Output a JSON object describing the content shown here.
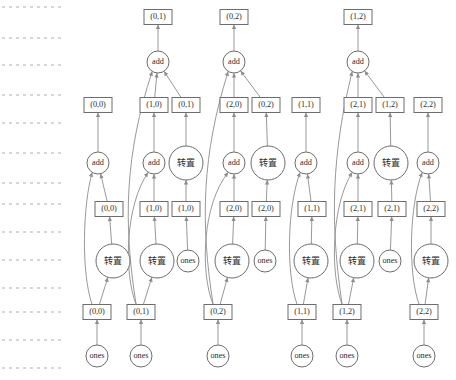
{
  "diagram": {
    "width": 456,
    "height": 380,
    "background_color": "#ffffff",
    "node_stroke_color": "#6d6d6d",
    "edge_color": "#8d8d8d",
    "guide_color": "#9a9a9a",
    "text_color": "#2b2b2b",
    "operator_labels": {
      "add": "add",
      "transpose": "转置",
      "ones": "ones"
    },
    "rank_guides": [
      {
        "name": "rank-guide-1",
        "y": 7
      },
      {
        "name": "rank-guide-2",
        "y": 38
      },
      {
        "name": "rank-guide-3",
        "y": 65
      },
      {
        "name": "rank-guide-4",
        "y": 95
      },
      {
        "name": "rank-guide-5",
        "y": 123
      },
      {
        "name": "rank-guide-6",
        "y": 153
      },
      {
        "name": "rank-guide-7",
        "y": 183
      },
      {
        "name": "rank-guide-8",
        "y": 204
      },
      {
        "name": "rank-guide-9",
        "y": 232
      },
      {
        "name": "rank-guide-10",
        "y": 260
      },
      {
        "name": "rank-guide-11",
        "y": 288
      },
      {
        "name": "rank-guide-12",
        "y": 312
      },
      {
        "name": "rank-guide-13",
        "y": 340
      },
      {
        "name": "rank-guide-14",
        "y": 368
      }
    ],
    "guide_x_start": 2,
    "guide_x_end": 62,
    "nodes": [
      {
        "id": "b_0_1_top",
        "shape": "box",
        "label": "(0,1)",
        "x": 158,
        "y": 17,
        "w": 28,
        "h": 15
      },
      {
        "id": "b_0_2_top",
        "shape": "box",
        "label": "(0,2)",
        "x": 234,
        "y": 17,
        "w": 28,
        "h": 15
      },
      {
        "id": "b_1_2_top",
        "shape": "box",
        "label": "(1,2)",
        "x": 358,
        "y": 17,
        "w": 28,
        "h": 15
      },
      {
        "id": "add_t1",
        "shape": "circle",
        "label": "add",
        "x": 158,
        "y": 62,
        "r": 11
      },
      {
        "id": "add_t2",
        "shape": "circle",
        "label": "add",
        "x": 234,
        "y": 62,
        "r": 11
      },
      {
        "id": "add_t3",
        "shape": "circle",
        "label": "add",
        "x": 358,
        "y": 62,
        "r": 11
      },
      {
        "id": "b_0_0_m",
        "shape": "box",
        "label": "(0,0)",
        "x": 98,
        "y": 105,
        "w": 28,
        "h": 15
      },
      {
        "id": "b_1_0_m",
        "shape": "box",
        "label": "(1,0)",
        "x": 154,
        "y": 105,
        "w": 28,
        "h": 15
      },
      {
        "id": "b_0_1_m",
        "shape": "box",
        "label": "(0,1)",
        "x": 186,
        "y": 105,
        "w": 28,
        "h": 15
      },
      {
        "id": "b_2_0_m",
        "shape": "box",
        "label": "(2,0)",
        "x": 234,
        "y": 105,
        "w": 28,
        "h": 15
      },
      {
        "id": "b_0_2_m",
        "shape": "box",
        "label": "(0,2)",
        "x": 266,
        "y": 105,
        "w": 28,
        "h": 15
      },
      {
        "id": "b_1_1_m",
        "shape": "box",
        "label": "(1,1)",
        "x": 306,
        "y": 105,
        "w": 28,
        "h": 15
      },
      {
        "id": "b_2_1_m",
        "shape": "box",
        "label": "(2,1)",
        "x": 358,
        "y": 105,
        "w": 28,
        "h": 15
      },
      {
        "id": "b_1_2_m",
        "shape": "box",
        "label": "(1,2)",
        "x": 390,
        "y": 105,
        "w": 28,
        "h": 15
      },
      {
        "id": "b_2_2_m",
        "shape": "box",
        "label": "(2,2)",
        "x": 428,
        "y": 105,
        "w": 28,
        "h": 15
      },
      {
        "id": "add_m1",
        "shape": "circle",
        "label": "add",
        "x": 98,
        "y": 163,
        "r": 11
      },
      {
        "id": "add_m2",
        "shape": "circle",
        "label": "add",
        "x": 154,
        "y": 163,
        "r": 11
      },
      {
        "id": "tr_m1",
        "shape": "circle",
        "label": "转置",
        "x": 186,
        "y": 163,
        "r": 17
      },
      {
        "id": "add_m3",
        "shape": "circle",
        "label": "add",
        "x": 234,
        "y": 163,
        "r": 11
      },
      {
        "id": "tr_m2",
        "shape": "circle",
        "label": "转置",
        "x": 268,
        "y": 163,
        "r": 17
      },
      {
        "id": "add_m4",
        "shape": "circle",
        "label": "add",
        "x": 306,
        "y": 163,
        "r": 11
      },
      {
        "id": "add_m5",
        "shape": "circle",
        "label": "add",
        "x": 358,
        "y": 163,
        "r": 11
      },
      {
        "id": "tr_m3",
        "shape": "circle",
        "label": "转置",
        "x": 391,
        "y": 163,
        "r": 17
      },
      {
        "id": "add_m6",
        "shape": "circle",
        "label": "add",
        "x": 428,
        "y": 163,
        "r": 11
      },
      {
        "id": "b_0_0_l",
        "shape": "box",
        "label": "(0,0)",
        "x": 109,
        "y": 209,
        "w": 28,
        "h": 15
      },
      {
        "id": "b_1_0_l",
        "shape": "box",
        "label": "(1,0)",
        "x": 154,
        "y": 209,
        "w": 28,
        "h": 15
      },
      {
        "id": "b_1_0_l2",
        "shape": "box",
        "label": "(1,0)",
        "x": 186,
        "y": 209,
        "w": 28,
        "h": 15
      },
      {
        "id": "b_2_0_l",
        "shape": "box",
        "label": "(2,0)",
        "x": 234,
        "y": 209,
        "w": 28,
        "h": 15
      },
      {
        "id": "b_2_0_l2",
        "shape": "box",
        "label": "(2,0)",
        "x": 266,
        "y": 209,
        "w": 28,
        "h": 15
      },
      {
        "id": "b_1_1_l",
        "shape": "box",
        "label": "(1,1)",
        "x": 312,
        "y": 209,
        "w": 28,
        "h": 15
      },
      {
        "id": "b_2_1_l",
        "shape": "box",
        "label": "(2,1)",
        "x": 358,
        "y": 209,
        "w": 28,
        "h": 15
      },
      {
        "id": "b_2_1_l2",
        "shape": "box",
        "label": "(2,1)",
        "x": 392,
        "y": 209,
        "w": 28,
        "h": 15
      },
      {
        "id": "b_2_2_l",
        "shape": "box",
        "label": "(2,2)",
        "x": 431,
        "y": 209,
        "w": 28,
        "h": 15
      },
      {
        "id": "tr_b1",
        "shape": "circle",
        "label": "转置",
        "x": 113,
        "y": 261,
        "r": 17
      },
      {
        "id": "tr_b2",
        "shape": "circle",
        "label": "转置",
        "x": 157,
        "y": 261,
        "r": 17
      },
      {
        "id": "ones_b1",
        "shape": "circle",
        "label": "ones",
        "x": 188,
        "y": 261,
        "r": 11
      },
      {
        "id": "tr_b3",
        "shape": "circle",
        "label": "转置",
        "x": 232,
        "y": 261,
        "r": 17
      },
      {
        "id": "ones_b2",
        "shape": "circle",
        "label": "ones",
        "x": 265,
        "y": 261,
        "r": 11
      },
      {
        "id": "tr_b4",
        "shape": "circle",
        "label": "转置",
        "x": 311,
        "y": 261,
        "r": 17
      },
      {
        "id": "tr_b5",
        "shape": "circle",
        "label": "转置",
        "x": 357,
        "y": 261,
        "r": 17
      },
      {
        "id": "ones_b3",
        "shape": "circle",
        "label": "ones",
        "x": 390,
        "y": 261,
        "r": 11
      },
      {
        "id": "tr_b6",
        "shape": "circle",
        "label": "转置",
        "x": 431,
        "y": 261,
        "r": 17
      },
      {
        "id": "b_0_0_f",
        "shape": "box",
        "label": "(0,0)",
        "x": 97,
        "y": 312,
        "w": 28,
        "h": 15
      },
      {
        "id": "b_0_1_f",
        "shape": "box",
        "label": "(0,1)",
        "x": 141,
        "y": 312,
        "w": 28,
        "h": 15
      },
      {
        "id": "b_0_2_f",
        "shape": "box",
        "label": "(0,2)",
        "x": 218,
        "y": 312,
        "w": 28,
        "h": 15
      },
      {
        "id": "b_1_1_f",
        "shape": "box",
        "label": "(1,1)",
        "x": 302,
        "y": 312,
        "w": 28,
        "h": 15
      },
      {
        "id": "b_1_2_f",
        "shape": "box",
        "label": "(1,2)",
        "x": 347,
        "y": 312,
        "w": 28,
        "h": 15
      },
      {
        "id": "b_2_2_f",
        "shape": "box",
        "label": "(2,2)",
        "x": 424,
        "y": 312,
        "w": 28,
        "h": 15
      },
      {
        "id": "ones_f1",
        "shape": "circle",
        "label": "ones",
        "x": 97,
        "y": 356,
        "r": 11
      },
      {
        "id": "ones_f2",
        "shape": "circle",
        "label": "ones",
        "x": 141,
        "y": 356,
        "r": 11
      },
      {
        "id": "ones_f3",
        "shape": "circle",
        "label": "ones",
        "x": 218,
        "y": 356,
        "r": 11
      },
      {
        "id": "ones_f4",
        "shape": "circle",
        "label": "ones",
        "x": 302,
        "y": 356,
        "r": 11
      },
      {
        "id": "ones_f5",
        "shape": "circle",
        "label": "ones",
        "x": 347,
        "y": 356,
        "r": 11
      },
      {
        "id": "ones_f6",
        "shape": "circle",
        "label": "ones",
        "x": 424,
        "y": 356,
        "r": 11
      }
    ],
    "edges": [
      {
        "from": "add_t1",
        "to": "b_0_1_top",
        "curve": "straight"
      },
      {
        "from": "add_t2",
        "to": "b_0_2_top",
        "curve": "straight"
      },
      {
        "from": "add_t3",
        "to": "b_1_2_top",
        "curve": "straight"
      },
      {
        "from": "b_1_0_m",
        "to": "add_t1",
        "curve": "straight"
      },
      {
        "from": "b_0_1_m",
        "to": "add_t1",
        "curve": "straight"
      },
      {
        "from": "b_0_1_f",
        "to": "add_t1",
        "curve": "long-left"
      },
      {
        "from": "b_2_0_m",
        "to": "add_t2",
        "curve": "straight"
      },
      {
        "from": "b_0_2_m",
        "to": "add_t2",
        "curve": "straight"
      },
      {
        "from": "b_0_2_f",
        "to": "add_t2",
        "curve": "long-left"
      },
      {
        "from": "b_2_1_m",
        "to": "add_t3",
        "curve": "straight"
      },
      {
        "from": "b_1_2_m",
        "to": "add_t3",
        "curve": "straight"
      },
      {
        "from": "b_1_2_f",
        "to": "add_t3",
        "curve": "long-left"
      },
      {
        "from": "add_m1",
        "to": "b_0_0_m",
        "curve": "straight"
      },
      {
        "from": "add_m2",
        "to": "b_1_0_m",
        "curve": "straight"
      },
      {
        "from": "tr_m1",
        "to": "b_0_1_m",
        "curve": "straight"
      },
      {
        "from": "add_m3",
        "to": "b_2_0_m",
        "curve": "straight"
      },
      {
        "from": "tr_m2",
        "to": "b_0_2_m",
        "curve": "straight"
      },
      {
        "from": "add_m4",
        "to": "b_1_1_m",
        "curve": "straight"
      },
      {
        "from": "add_m5",
        "to": "b_2_1_m",
        "curve": "straight"
      },
      {
        "from": "tr_m3",
        "to": "b_1_2_m",
        "curve": "straight"
      },
      {
        "from": "add_m6",
        "to": "b_2_2_m",
        "curve": "straight"
      },
      {
        "from": "b_0_0_l",
        "to": "add_m1",
        "curve": "straight"
      },
      {
        "from": "b_0_0_f",
        "to": "add_m1",
        "curve": "long-left"
      },
      {
        "from": "b_1_0_l",
        "to": "add_m2",
        "curve": "straight"
      },
      {
        "from": "b_1_0_l2",
        "to": "tr_m1",
        "curve": "straight"
      },
      {
        "from": "b_0_1_f",
        "to": "add_m2",
        "curve": "long-left"
      },
      {
        "from": "b_2_0_l",
        "to": "add_m3",
        "curve": "straight"
      },
      {
        "from": "b_2_0_l2",
        "to": "tr_m2",
        "curve": "straight"
      },
      {
        "from": "b_0_2_f",
        "to": "add_m3",
        "curve": "long-left"
      },
      {
        "from": "b_1_1_l",
        "to": "add_m4",
        "curve": "straight"
      },
      {
        "from": "b_1_1_f",
        "to": "add_m4",
        "curve": "long-left"
      },
      {
        "from": "b_2_1_l",
        "to": "add_m5",
        "curve": "straight"
      },
      {
        "from": "b_2_1_l2",
        "to": "tr_m3",
        "curve": "straight"
      },
      {
        "from": "b_1_2_f",
        "to": "add_m5",
        "curve": "long-left"
      },
      {
        "from": "b_2_2_l",
        "to": "add_m6",
        "curve": "straight"
      },
      {
        "from": "b_2_2_f",
        "to": "add_m6",
        "curve": "long-left"
      },
      {
        "from": "tr_b1",
        "to": "b_0_0_l",
        "curve": "straight"
      },
      {
        "from": "tr_b2",
        "to": "b_1_0_l",
        "curve": "straight"
      },
      {
        "from": "ones_b1",
        "to": "b_1_0_l2",
        "curve": "straight"
      },
      {
        "from": "tr_b3",
        "to": "b_2_0_l",
        "curve": "straight"
      },
      {
        "from": "ones_b2",
        "to": "b_2_0_l2",
        "curve": "straight"
      },
      {
        "from": "tr_b4",
        "to": "b_1_1_l",
        "curve": "straight"
      },
      {
        "from": "tr_b5",
        "to": "b_2_1_l",
        "curve": "straight"
      },
      {
        "from": "ones_b3",
        "to": "b_2_1_l2",
        "curve": "straight"
      },
      {
        "from": "tr_b6",
        "to": "b_2_2_l",
        "curve": "straight"
      },
      {
        "from": "b_0_0_f",
        "to": "tr_b1",
        "curve": "straight"
      },
      {
        "from": "b_0_1_f",
        "to": "tr_b2",
        "curve": "straight"
      },
      {
        "from": "b_0_2_f",
        "to": "tr_b3",
        "curve": "straight"
      },
      {
        "from": "b_1_1_f",
        "to": "tr_b4",
        "curve": "straight"
      },
      {
        "from": "b_1_2_f",
        "to": "tr_b5",
        "curve": "straight"
      },
      {
        "from": "b_2_2_f",
        "to": "tr_b6",
        "curve": "straight"
      },
      {
        "from": "ones_f1",
        "to": "b_0_0_f",
        "curve": "straight"
      },
      {
        "from": "ones_f2",
        "to": "b_0_1_f",
        "curve": "straight"
      },
      {
        "from": "ones_f3",
        "to": "b_0_2_f",
        "curve": "straight"
      },
      {
        "from": "ones_f4",
        "to": "b_1_1_f",
        "curve": "straight"
      },
      {
        "from": "ones_f5",
        "to": "b_1_2_f",
        "curve": "straight"
      },
      {
        "from": "ones_f6",
        "to": "b_2_2_f",
        "curve": "straight"
      }
    ]
  }
}
